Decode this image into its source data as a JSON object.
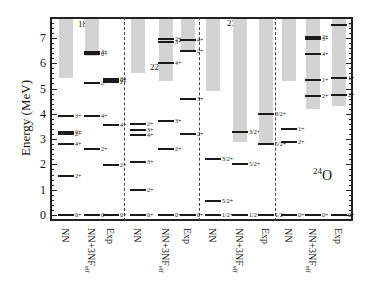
{
  "figure": {
    "y_axis_label": "Energy (MeV)",
    "y_ticks": [
      "0",
      "1",
      "2",
      "3",
      "4",
      "5",
      "6",
      "7"
    ],
    "x_column_labels": [
      "NN",
      "NN+3NF",
      "Exp"
    ],
    "x_subscript": "eff"
  },
  "panels": [
    {
      "nucleus": "O",
      "mass": "18",
      "columns": [
        {
          "label": "NN",
          "band": [
            5.4,
            7.8
          ],
          "levels": [
            {
              "E": 0,
              "J": "0+"
            },
            {
              "E": 1.55,
              "J": "2+"
            },
            {
              "E": 2.8,
              "J": "4+"
            },
            {
              "E": 3.2,
              "J": "2+"
            },
            {
              "E": 3.3,
              "J": "0+"
            },
            {
              "E": 3.9,
              "J": "3+"
            }
          ]
        },
        {
          "label": "NN+3NF",
          "band": [
            6.3,
            7.8
          ],
          "levels": [
            {
              "E": 0,
              "J": "0+"
            },
            {
              "E": 2.6,
              "J": "2+"
            },
            {
              "E": 3.9,
              "J": "4+"
            },
            {
              "E": 5.2,
              "J": "2+"
            },
            {
              "E": 6.35,
              "J": "0+"
            },
            {
              "E": 6.45,
              "J": "3+"
            }
          ]
        },
        {
          "label": "Exp",
          "band": null,
          "levels": [
            {
              "E": 0,
              "J": "0+"
            },
            {
              "E": 1.98,
              "J": "2+"
            },
            {
              "E": 3.55,
              "J": "4+"
            },
            {
              "E": 5.25,
              "J": "2+"
            },
            {
              "E": 5.33,
              "J": "0+"
            },
            {
              "E": 5.38,
              "J": "3+"
            }
          ]
        }
      ]
    },
    {
      "nucleus": "O",
      "mass": "22",
      "columns": [
        {
          "label": "NN",
          "band": [
            5.6,
            7.8
          ],
          "levels": [
            {
              "E": 0,
              "J": "0+"
            },
            {
              "E": 1.0,
              "J": "2+"
            },
            {
              "E": 2.1,
              "J": "3+"
            },
            {
              "E": 3.15,
              "J": "4+"
            },
            {
              "E": 3.35,
              "J": "3+"
            },
            {
              "E": 3.6,
              "J": "2+"
            }
          ]
        },
        {
          "label": "NN+3NF",
          "band": [
            5.3,
            7.8
          ],
          "levels": [
            {
              "E": 0,
              "J": "0+"
            },
            {
              "E": 2.6,
              "J": "2+"
            },
            {
              "E": 3.7,
              "J": "3+"
            },
            {
              "E": 6.0,
              "J": "4+"
            },
            {
              "E": 6.85,
              "J": "3+"
            },
            {
              "E": 6.95,
              "J": "2+"
            }
          ]
        },
        {
          "label": "Exp",
          "band": [
            6.5,
            7.8
          ],
          "levels": [
            {
              "E": 0,
              "J": "0+"
            },
            {
              "E": 3.2,
              "J": "2+"
            },
            {
              "E": 4.6,
              "J": "3+"
            },
            {
              "E": 6.5,
              "J": "2+"
            },
            {
              "E": 6.9,
              "J": "4+"
            }
          ]
        }
      ]
    },
    {
      "nucleus": "O",
      "mass": "23",
      "columns": [
        {
          "label": "NN",
          "band": [
            4.9,
            7.8
          ],
          "levels": [
            {
              "E": 0,
              "J": "1/2+"
            },
            {
              "E": 0.55,
              "J": "5/2+"
            },
            {
              "E": 2.2,
              "J": "3/2+"
            }
          ]
        },
        {
          "label": "NN+3NF",
          "band": [
            2.9,
            7.8
          ],
          "levels": [
            {
              "E": 0,
              "J": "1/2+"
            },
            {
              "E": 2.0,
              "J": "5/2+"
            },
            {
              "E": 3.3,
              "J": "3/2+"
            }
          ]
        },
        {
          "label": "Exp",
          "band": [
            2.8,
            7.8
          ],
          "levels": [
            {
              "E": 0,
              "J": "1/2+"
            },
            {
              "E": 2.8,
              "J": "5/2+"
            },
            {
              "E": 4.0,
              "J": "3/2+"
            }
          ]
        }
      ]
    },
    {
      "nucleus": "O",
      "mass": "24",
      "columns": [
        {
          "label": "NN",
          "band": [
            5.3,
            7.8
          ],
          "levels": [
            {
              "E": 0,
              "J": "0+"
            },
            {
              "E": 2.9,
              "J": "2+"
            },
            {
              "E": 3.4,
              "J": "1+"
            }
          ]
        },
        {
          "label": "NN+3NF",
          "band": [
            4.2,
            7.8
          ],
          "levels": [
            {
              "E": 0,
              "J": "0+"
            },
            {
              "E": 4.7,
              "J": "2+"
            },
            {
              "E": 5.35,
              "J": "1+"
            },
            {
              "E": 6.35,
              "J": "4+"
            },
            {
              "E": 6.95,
              "J": "3+"
            },
            {
              "E": 7.05,
              "J": "2+"
            }
          ]
        },
        {
          "label": "Exp",
          "band": [
            4.3,
            7.8
          ],
          "levels": [
            {
              "E": 0,
              "J": "0+"
            },
            {
              "E": 4.75,
              "J": "2+"
            },
            {
              "E": 5.4,
              "J": "1+"
            },
            {
              "E": 7.5,
              "J": "?"
            }
          ]
        }
      ]
    }
  ],
  "chart_data": {
    "type": "level-scheme",
    "title": "",
    "ylabel": "Energy (MeV)",
    "ylim": [
      -0.2,
      7.8
    ],
    "categories": [
      "18O",
      "22O",
      "23O",
      "24O"
    ],
    "sub_categories": [
      "NN",
      "NN+3NF_eff",
      "Exp"
    ],
    "note": "Gray bands mark continuum / shaded region above threshold"
  }
}
